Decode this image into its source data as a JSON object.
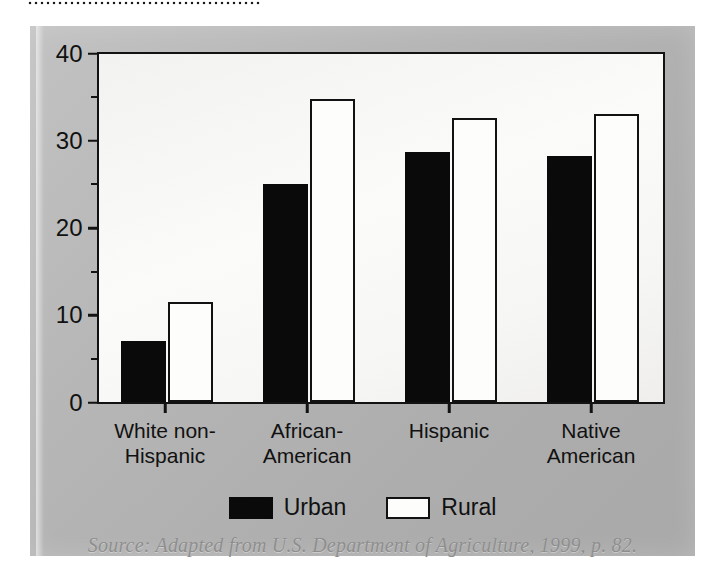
{
  "figure": {
    "source_note": "Source: Adapted from U.S. Department of Agriculture, 1999, p. 82.",
    "panel_color": "#b6b6b6",
    "plot_background": "#f8f8f6",
    "axis_color": "#121212"
  },
  "chart_data": {
    "type": "bar",
    "title": "",
    "subtitle": "",
    "xlabel": "",
    "ylabel": "",
    "ylim": [
      0,
      40
    ],
    "y_ticks_major": [
      0,
      10,
      20,
      30,
      40
    ],
    "y_ticks_minor": [
      5,
      15,
      25,
      35
    ],
    "y_tick_labels": [
      "0",
      "10",
      "20",
      "30",
      "40"
    ],
    "grid": false,
    "legend_position": "bottom-center",
    "categories": [
      "White non-\nHispanic",
      "African-\nAmerican",
      "Hispanic",
      "Native\nAmerican"
    ],
    "category_lines": [
      [
        "White non-",
        "Hispanic"
      ],
      [
        "African-",
        "American"
      ],
      [
        "Hispanic"
      ],
      [
        "Native",
        "American"
      ]
    ],
    "series": [
      {
        "name": "Urban",
        "color": "#0a0a0a",
        "style": "filled",
        "values": [
          7,
          25,
          28.7,
          28.2
        ]
      },
      {
        "name": "Rural",
        "color": "#fdfdfc",
        "style": "outlined",
        "values": [
          11.5,
          34.7,
          32.5,
          33
        ]
      }
    ]
  },
  "legend": {
    "entries": [
      {
        "label": "Urban",
        "swatch": "urban"
      },
      {
        "label": "Rural",
        "swatch": "rural"
      }
    ]
  }
}
